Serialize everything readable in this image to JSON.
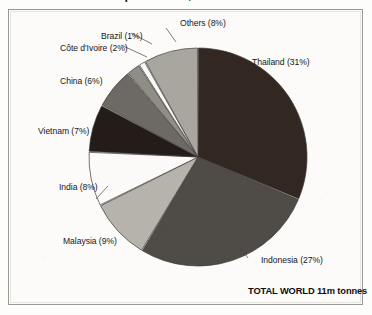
{
  "headline": {
    "text": "in the natural rubber production, 2000"
  },
  "figure": {
    "total_label": "TOTAL WORLD 11m tonnes"
  },
  "colors": {
    "slice_very_dark": "#332722",
    "slice_dark_gray": "#4f4c48",
    "slice_mid_gray": "#908d87",
    "slice_light_gray": "#b6b3ad",
    "slice_white": "#fbfaf8",
    "slice_near_black": "#241c18",
    "slice_medium_dark": "#6d6a65",
    "outline": "#3c3a36",
    "frame": "#9a9a92",
    "text": "#17171a",
    "background": "#fdfdfc"
  },
  "chart_data": {
    "type": "pie",
    "title": "in the natural rubber production, 2000",
    "total_label": "TOTAL WORLD 11m tonnes",
    "total_value": 11,
    "total_units": "m tonnes",
    "grid": false,
    "legend": "none",
    "label_format": "{name} ({value}%)",
    "start_angle_deg": 0,
    "direction": "clockwise",
    "categories": [
      "Thailand",
      "Indonesia",
      "Malaysia",
      "India",
      "Vietnam",
      "China",
      "Côte d'Ivoire",
      "Brazil",
      "Others"
    ],
    "values": [
      31,
      27,
      9,
      8,
      7,
      6,
      2,
      1,
      8
    ],
    "slices": [
      {
        "name": "Thailand",
        "value": 31,
        "label": "Thailand (31%)",
        "fill": "#332722"
      },
      {
        "name": "Indonesia",
        "value": 27,
        "label": "Indonesia (27%)",
        "fill": "#4f4c48"
      },
      {
        "name": "Malaysia",
        "value": 9,
        "label": "Malaysia (9%)",
        "fill": "#b6b3ad"
      },
      {
        "name": "India",
        "value": 8,
        "label": "India (8%)",
        "fill": "#fbfaf8"
      },
      {
        "name": "Vietnam",
        "value": 7,
        "label": "Vietnam (7%)",
        "fill": "#241c18"
      },
      {
        "name": "China",
        "value": 6,
        "label": "China (6%)",
        "fill": "#6d6a65"
      },
      {
        "name": "Côte d'Ivoire",
        "value": 2,
        "label": "Côte d'Ivoire (2%)",
        "fill": "#908d87"
      },
      {
        "name": "Brazil",
        "value": 1,
        "label": "Brazil (1%)",
        "fill": "#fbfaf8"
      },
      {
        "name": "Others",
        "value": 8,
        "label": "Others (8%)",
        "fill": "#a9a69f"
      }
    ]
  }
}
